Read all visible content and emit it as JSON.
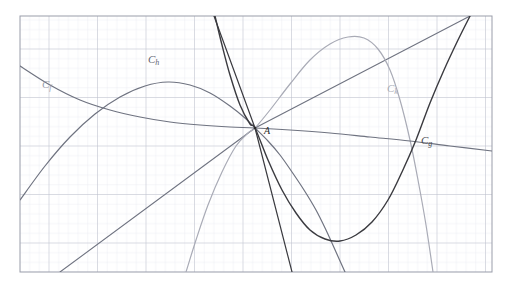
{
  "figure": {
    "title": "",
    "background_color": "#ffffff",
    "plot_area": {
      "x": 20,
      "y": 16,
      "width": 472,
      "height": 256
    },
    "grid": {
      "minor_spacing_px": 9.7,
      "major_every": 5,
      "minor_color": "#e7e9f0",
      "major_color": "#b9bcc9",
      "border_color": "#9a9daa",
      "visible": true
    }
  },
  "labels": {
    "curve_f": {
      "text": "C",
      "sub": "f",
      "x": 42,
      "y": 78
    },
    "curve_h": {
      "text": "C",
      "sub": "h",
      "x": 148,
      "y": 53
    },
    "curve_k": {
      "text": "C",
      "sub": "k",
      "x": 387,
      "y": 82
    },
    "curve_g": {
      "text": "C",
      "sub": "g",
      "x": 421,
      "y": 134
    },
    "point_a": {
      "text": "A",
      "x": 264,
      "y": 125
    }
  },
  "chart_data": {
    "type": "line",
    "title": "",
    "xlabel": "",
    "ylabel": "",
    "grid": true,
    "legend": "inline-curve-labels",
    "common_point": {
      "name": "A",
      "px": [
        255,
        128
      ]
    },
    "series": [
      {
        "name": "C_f",
        "label": "Cf",
        "color": "#6f7380",
        "width": 1.2,
        "description": "decreasing convex curve from upper-left through A continuing to lower-right",
        "points_px": [
          [
            20,
            66
          ],
          [
            50,
            85
          ],
          [
            80,
            100
          ],
          [
            110,
            110
          ],
          [
            140,
            117
          ],
          [
            170,
            122
          ],
          [
            200,
            125
          ],
          [
            230,
            127
          ],
          [
            255,
            128
          ],
          [
            290,
            130
          ],
          [
            330,
            133
          ],
          [
            370,
            137
          ],
          [
            410,
            141
          ],
          [
            450,
            146
          ],
          [
            492,
            151
          ]
        ]
      },
      {
        "name": "C_h",
        "label": "Ch",
        "color": "#6f7380",
        "width": 1.2,
        "description": "downward parabola peaking near x=165 then descending through A",
        "points_px": [
          [
            20,
            200
          ],
          [
            45,
            166
          ],
          [
            70,
            137
          ],
          [
            95,
            114
          ],
          [
            120,
            97
          ],
          [
            145,
            86
          ],
          [
            168,
            82
          ],
          [
            190,
            85
          ],
          [
            210,
            93
          ],
          [
            230,
            106
          ],
          [
            245,
            118
          ],
          [
            255,
            128
          ],
          [
            268,
            141
          ],
          [
            280,
            155
          ],
          [
            292,
            172
          ],
          [
            304,
            190
          ],
          [
            316,
            210
          ],
          [
            326,
            230
          ],
          [
            336,
            252
          ],
          [
            345,
            272
          ]
        ]
      },
      {
        "name": "C_k",
        "label": "Ck",
        "color": "#a9abb6",
        "width": 1.2,
        "description": "light-gray arch rising from lower-left, peaking near x=330, falling steeply at right",
        "points_px": [
          [
            186,
            272
          ],
          [
            196,
            240
          ],
          [
            208,
            205
          ],
          [
            222,
            172
          ],
          [
            236,
            146
          ],
          [
            248,
            133
          ],
          [
            255,
            128
          ],
          [
            270,
            110
          ],
          [
            290,
            84
          ],
          [
            310,
            60
          ],
          [
            330,
            44
          ],
          [
            348,
            37
          ],
          [
            364,
            38
          ],
          [
            378,
            49
          ],
          [
            390,
            70
          ],
          [
            400,
            100
          ],
          [
            410,
            140
          ],
          [
            418,
            180
          ],
          [
            426,
            225
          ],
          [
            433,
            272
          ]
        ]
      },
      {
        "name": "C_g",
        "label": "Cg",
        "color": "#3a3a3f",
        "width": 1.4,
        "description": "upward parabola with vertex near (335,240), rising through A to the upper right",
        "points_px": [
          [
            215,
            16
          ],
          [
            222,
            45
          ],
          [
            230,
            75
          ],
          [
            240,
            105
          ],
          [
            250,
            124
          ],
          [
            255,
            128
          ],
          [
            268,
            160
          ],
          [
            282,
            190
          ],
          [
            296,
            213
          ],
          [
            310,
            230
          ],
          [
            325,
            239
          ],
          [
            340,
            241
          ],
          [
            356,
            235
          ],
          [
            372,
            222
          ],
          [
            388,
            200
          ],
          [
            402,
            172
          ],
          [
            416,
            140
          ],
          [
            430,
            103
          ],
          [
            444,
            70
          ],
          [
            458,
            40
          ],
          [
            470,
            16
          ]
        ]
      },
      {
        "name": "tangent_line_1",
        "label": "",
        "color": "#3a3a3f",
        "width": 1.2,
        "description": "steep straight line descending left-to-right through A toward lower right",
        "points_px": [
          [
            214,
            16
          ],
          [
            255,
            128
          ],
          [
            292,
            272
          ]
        ]
      },
      {
        "name": "tangent_line_2",
        "label": "",
        "color": "#6f7380",
        "width": 1.1,
        "description": "steep straight line rising left-to-right through A toward upper right",
        "points_px": [
          [
            60,
            272
          ],
          [
            255,
            128
          ],
          [
            470,
            16
          ]
        ]
      }
    ]
  }
}
